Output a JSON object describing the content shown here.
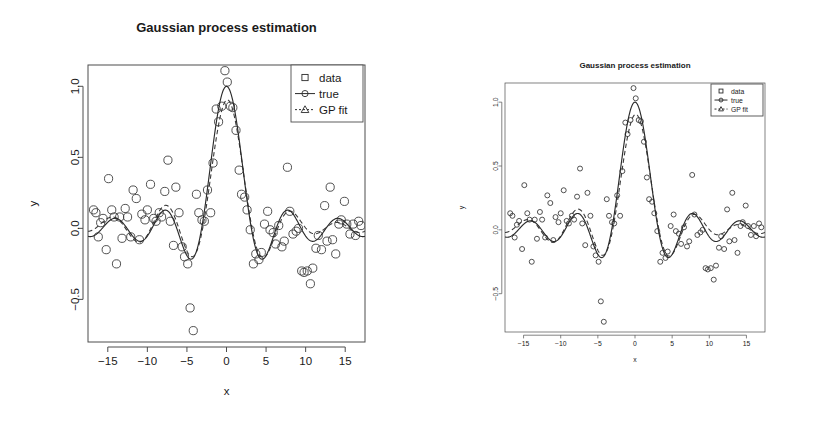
{
  "figure": {
    "background": "#ffffff",
    "panels": [
      {
        "id": "left",
        "title": "Gaussian process estimation",
        "xlabel": "x",
        "ylabel": "y"
      },
      {
        "id": "right",
        "title": "Gaussian process estimation",
        "xlabel": "x",
        "ylabel": "y"
      }
    ]
  },
  "legend": {
    "position": "top-right",
    "items": [
      {
        "label": "data",
        "symbol": "square",
        "line": "none"
      },
      {
        "label": "true",
        "symbol": "circle",
        "line": "solid"
      },
      {
        "label": "GP fit",
        "symbol": "triangle",
        "line": "dashed"
      }
    ]
  },
  "chart_data": {
    "type": "scatter",
    "title": "Gaussian process estimation",
    "xlabel": "x",
    "ylabel": "y",
    "xlim": [
      -17.5,
      17.5
    ],
    "ylim": [
      -0.8,
      1.15
    ],
    "xticks": [
      -15,
      -10,
      -5,
      0,
      5,
      10,
      15
    ],
    "xticklabels": [
      "-15",
      "-10",
      "-5",
      "0",
      "5",
      "10",
      "15"
    ],
    "yticks": [
      -0.5,
      0.0,
      0.5,
      1.0
    ],
    "yticklabels": [
      "-0.5",
      "0.0",
      "0.5",
      "1.0"
    ],
    "grid": false,
    "note": "Noisy observations of a sinc-like function sin(x)/x; 'true' is the generating curve, 'GP fit' is the posterior mean of a Gaussian process regression.",
    "series": [
      {
        "name": "data",
        "marker": "circle",
        "x": [
          -16.8,
          -16.5,
          -16.2,
          -15.9,
          -15.6,
          -15.2,
          -14.9,
          -14.5,
          -14.2,
          -13.9,
          -13.5,
          -13.2,
          -12.8,
          -12.5,
          -12.1,
          -11.8,
          -11.4,
          -11.0,
          -10.7,
          -10.3,
          -10.0,
          -9.6,
          -9.2,
          -8.9,
          -8.5,
          -8.2,
          -7.8,
          -7.4,
          -7.1,
          -6.7,
          -6.4,
          -6.0,
          -5.6,
          -5.3,
          -4.9,
          -4.6,
          -4.2,
          -3.8,
          -3.5,
          -3.1,
          -2.8,
          -2.4,
          -2.0,
          -1.7,
          -1.3,
          -1.0,
          -0.6,
          -0.2,
          0.1,
          0.5,
          0.8,
          1.2,
          1.6,
          1.9,
          2.3,
          2.6,
          3.0,
          3.4,
          3.7,
          4.1,
          4.4,
          4.8,
          5.2,
          5.5,
          5.9,
          6.2,
          6.6,
          7.0,
          7.3,
          7.7,
          8.0,
          8.4,
          8.8,
          9.1,
          9.5,
          9.8,
          10.2,
          10.6,
          10.9,
          11.3,
          11.6,
          12.0,
          12.4,
          12.7,
          13.1,
          13.4,
          13.8,
          14.2,
          14.5,
          14.9,
          15.2,
          15.6,
          16.0,
          16.3,
          16.7,
          17.0
        ],
        "y": [
          0.13,
          0.11,
          -0.06,
          0.04,
          0.07,
          -0.15,
          0.35,
          0.13,
          0.08,
          -0.25,
          0.08,
          -0.07,
          0.14,
          0.08,
          -0.06,
          0.27,
          0.21,
          -0.08,
          0.1,
          0.06,
          0.13,
          0.31,
          0.07,
          0.05,
          0.11,
          0.08,
          0.26,
          0.48,
          0.05,
          -0.12,
          0.29,
          0.11,
          -0.13,
          -0.2,
          -0.25,
          -0.56,
          -0.72,
          0.24,
          0.11,
          0.06,
          0.05,
          0.27,
          0.11,
          0.46,
          0.84,
          0.75,
          0.86,
          1.11,
          1.03,
          0.86,
          0.85,
          0.69,
          0.41,
          0.24,
          0.22,
          0.13,
          -0.01,
          -0.25,
          -0.18,
          -0.22,
          -0.17,
          0.03,
          0.12,
          -0.01,
          -0.03,
          -0.11,
          0.02,
          -0.13,
          -0.09,
          0.43,
          0.12,
          -0.04,
          -0.02,
          0.0,
          -0.3,
          -0.31,
          -0.3,
          -0.39,
          -0.28,
          -0.14,
          -0.05,
          -0.15,
          0.16,
          -0.09,
          0.29,
          -0.08,
          -0.18,
          0.03,
          0.06,
          0.19,
          0.03,
          -0.04,
          0.03,
          -0.05,
          0.05,
          0.02
        ]
      },
      {
        "name": "true",
        "marker": "circle",
        "line": "solid",
        "formula": "sin(x)/x",
        "amplitude_peak": 1.0,
        "peak_x": 0
      },
      {
        "name": "GP fit",
        "marker": "triangle",
        "line": "dashed",
        "description": "smoothed posterior mean; peak ~0.85 at x=0, damped oscillations in the tails",
        "peak_value": 0.85,
        "peak_x": 0
      }
    ]
  }
}
